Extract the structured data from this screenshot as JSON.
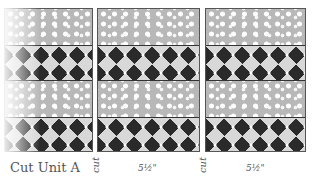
{
  "diagram": {
    "columns": [
      {
        "name": "strip-1",
        "bands": [
          "dots",
          "pattern",
          "dots",
          "pattern"
        ]
      },
      {
        "name": "strip-2",
        "bands": [
          "dots",
          "pattern",
          "dots",
          "pattern"
        ]
      },
      {
        "name": "strip-3",
        "bands": [
          "dots",
          "pattern",
          "dots",
          "pattern"
        ]
      }
    ],
    "labels": {
      "unit": "Cut Unit A",
      "cut_1": "cut",
      "dim_1": "5½\"",
      "cut_2": "cut",
      "dim_2": "5½\""
    },
    "colors": {
      "dots_fabric": "#b8b8b8",
      "pattern_fabric": "#9a9a9a",
      "outline": "#555555"
    }
  }
}
